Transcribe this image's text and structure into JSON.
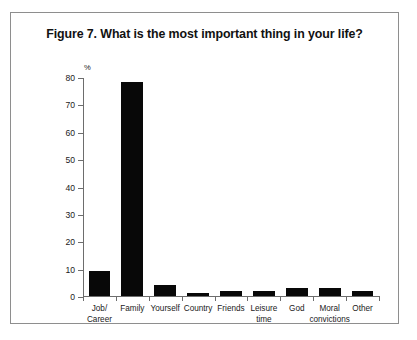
{
  "figure": {
    "title": "Figure 7. What is the most important thing in your life?",
    "border_color": "#8e8e8e",
    "background": "#ffffff"
  },
  "chart_data": {
    "type": "bar",
    "title": "Figure 7. What is the most important thing in your life?",
    "xlabel": "",
    "ylabel": "%",
    "unit_label": "%",
    "ylim": [
      0,
      80
    ],
    "yticks": [
      0,
      10,
      20,
      30,
      40,
      50,
      60,
      70,
      80
    ],
    "ytick_labels": [
      "0",
      "10",
      "20",
      "30",
      "40",
      "50",
      "60",
      "70",
      "80"
    ],
    "grid": false,
    "legend": false,
    "bar_color": "#080808",
    "axis_color": "#6d6d6d",
    "categories": [
      "Job/\nCareer",
      "Family",
      "Yourself",
      "Country",
      "Friends",
      "Leisure\ntime",
      "God",
      "Moral\nconvictions",
      "Other"
    ],
    "categories_flat": [
      "Job/Career",
      "Family",
      "Yourself",
      "Country",
      "Friends",
      "Leisure time",
      "God",
      "Moral convictions",
      "Other"
    ],
    "values": [
      9,
      78,
      4,
      1,
      2,
      2,
      3,
      3,
      2
    ]
  }
}
